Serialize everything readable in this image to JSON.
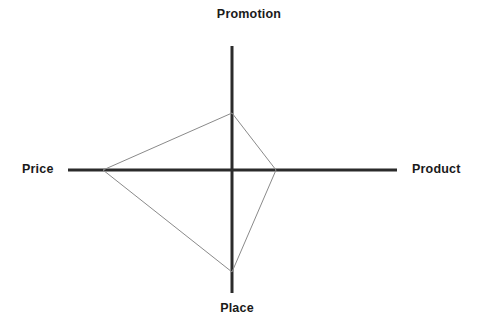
{
  "chart_data": {
    "type": "radar",
    "title": "",
    "categories": [
      "Promotion",
      "Product",
      "Place",
      "Price"
    ],
    "axis_labels": {
      "top": "Promotion",
      "right": "Product",
      "bottom": "Place",
      "left": "Price"
    },
    "series": [
      {
        "name": "",
        "values": [
          0.46,
          0.27,
          0.83,
          0.79
        ]
      }
    ],
    "value_range": [
      0,
      1
    ],
    "grid": false,
    "legend": false,
    "legend_position": "none",
    "center_px": {
      "x": 232,
      "y": 170
    },
    "axis_extent_px": {
      "top": 46,
      "bottom": 293,
      "left": 68,
      "right": 397
    },
    "vertex_points_px": [
      {
        "axis": "Promotion",
        "x": 232,
        "y": 113
      },
      {
        "axis": "Product",
        "x": 276,
        "y": 170
      },
      {
        "axis": "Place",
        "x": 232,
        "y": 272
      },
      {
        "axis": "Price",
        "x": 103,
        "y": 170
      }
    ],
    "polygon_path": "232,113 276,170 232,272 103,170",
    "colors": {
      "axis": "#2b2b2b",
      "polygon_stroke": "#8a8a8a",
      "polygon_fill": "none",
      "label_text": "#1a1a1a",
      "background": "#ffffff"
    },
    "stroke_widths": {
      "axis": 3,
      "polygon": 1
    }
  }
}
